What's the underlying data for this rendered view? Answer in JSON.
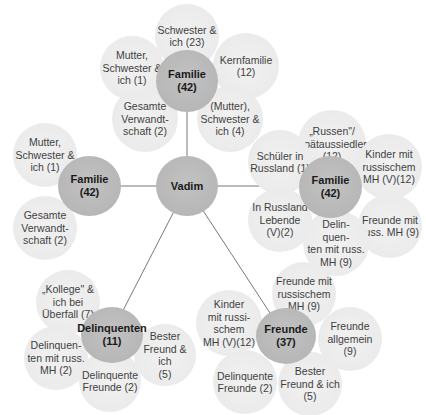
{
  "diagram": {
    "center": {
      "label": "Vadim"
    },
    "colors": {
      "main_circle": "#b6b6b6",
      "satellite_circle": "#ebebeb",
      "edge": "#555555",
      "text": "#3f3f3f"
    },
    "clusters": [
      {
        "id": "familie-top",
        "label": "Familie\n(42)",
        "satellites": [
          "Schwester &\nich (23)",
          "Kernfamilie\n(12)",
          "(Mutter),\nSchwester &\nich (4)",
          "Gesamte\nVerwandt-\nschaft (2)",
          "Mutter,\nSchwester &\nich (1)"
        ]
      },
      {
        "id": "familie-left",
        "label": "Familie\n(42)",
        "satellites": [
          "Mutter,\nSchwester &\nich (1)",
          "Gesamte\nVerwandt-\nschaft (2)"
        ]
      },
      {
        "id": "familie-right",
        "label": "Familie\n(42)",
        "satellites": [
          "„Russen\"/\nSpätaussiedler\n(12)",
          "Kinder mit\nrussischem\nMH (V)(12)",
          "Freunde mit\nruss. MH (9)",
          "Delin-\nquen-\nten mit russ.\nMH (9)",
          "In Russland\nLebende\n(V)(2)",
          "Schüler in\nRussland (1)"
        ]
      },
      {
        "id": "delinquenten",
        "label": "Delinquenten\n(11)",
        "satellites": [
          "„Kollege\" &\nich bei\nÜberfall (7)",
          "Delinquen-\nten mit russ.\nMH (2)",
          "Delinquente\nFreunde (2)",
          "Bester\nFreund & ich\n(5)"
        ]
      },
      {
        "id": "freunde",
        "label": "Freunde (37)",
        "satellites": [
          "Freunde mit\nrussischem\nMH (9)",
          "Freunde\nallgemein\n(9)",
          "Bester\nFreund & ich\n(5)",
          "Delinquente\nFreunde (2)",
          "Kinder\nmit russi-\nschem\nMH (V)(12)"
        ]
      }
    ]
  }
}
